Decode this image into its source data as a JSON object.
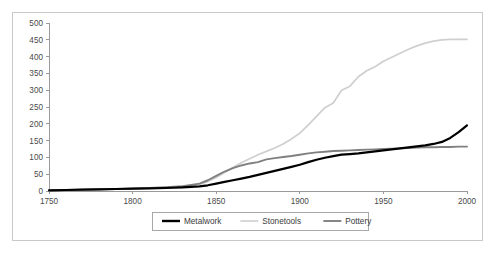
{
  "chart_data": {
    "type": "line",
    "title": "",
    "xlabel": "",
    "ylabel": "",
    "xlim": [
      1750,
      2000
    ],
    "ylim": [
      0,
      500
    ],
    "grid": false,
    "legend_position": "bottom",
    "x_ticks": [
      "1750",
      "1800",
      "1850",
      "1900",
      "1950",
      "2000"
    ],
    "y_ticks": [
      "0",
      "50",
      "100",
      "150",
      "200",
      "250",
      "300",
      "350",
      "400",
      "450",
      "500"
    ],
    "x": [
      1750,
      1760,
      1770,
      1780,
      1790,
      1800,
      1810,
      1820,
      1830,
      1840,
      1845,
      1850,
      1855,
      1860,
      1865,
      1870,
      1875,
      1880,
      1885,
      1890,
      1895,
      1900,
      1905,
      1910,
      1915,
      1920,
      1925,
      1930,
      1935,
      1940,
      1945,
      1950,
      1955,
      1960,
      1965,
      1970,
      1975,
      1980,
      1985,
      1990,
      1995,
      2000
    ],
    "series": [
      {
        "name": "Metalwork",
        "color": "#000000",
        "width": 2.2,
        "values": [
          2,
          3,
          4,
          5,
          6,
          7,
          8,
          9,
          11,
          14,
          17,
          22,
          27,
          32,
          37,
          42,
          48,
          54,
          60,
          66,
          72,
          78,
          86,
          93,
          99,
          104,
          108,
          110,
          112,
          115,
          118,
          121,
          124,
          127,
          130,
          133,
          136,
          140,
          146,
          158,
          175,
          195
        ]
      },
      {
        "name": "Stonetools",
        "color": "#cfcfcf",
        "width": 1.7,
        "values": [
          2,
          3,
          4,
          5,
          6,
          7,
          9,
          11,
          14,
          20,
          28,
          40,
          55,
          70,
          84,
          96,
          108,
          118,
          128,
          140,
          155,
          172,
          196,
          222,
          248,
          262,
          300,
          312,
          340,
          358,
          370,
          386,
          398,
          410,
          422,
          432,
          440,
          446,
          450,
          451,
          451,
          451
        ]
      },
      {
        "name": "Pottery",
        "color": "#808080",
        "width": 1.9,
        "values": [
          2,
          3,
          4,
          5,
          6,
          7,
          9,
          11,
          14,
          22,
          32,
          45,
          58,
          68,
          76,
          82,
          86,
          94,
          98,
          101,
          104,
          108,
          112,
          115,
          117,
          119,
          120,
          121,
          122,
          123,
          124,
          125,
          126,
          127,
          128,
          129,
          130,
          130,
          131,
          131,
          132,
          132
        ]
      }
    ],
    "legend_entries": [
      {
        "label": "Metalwork",
        "color": "#000000",
        "width": 2.4
      },
      {
        "label": "Stonetools",
        "color": "#cfcfcf",
        "width": 1.6
      },
      {
        "label": "Pottery",
        "color": "#808080",
        "width": 1.9
      }
    ]
  }
}
